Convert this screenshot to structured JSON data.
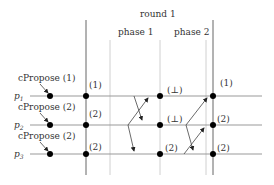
{
  "diagram": {
    "title": "round 1",
    "phases": [
      {
        "label": "phase 1"
      },
      {
        "label": "phase 2"
      }
    ],
    "processes": [
      {
        "name": "p1",
        "proposal": "cPropose (1)",
        "start_value": "(1)",
        "after_phase1": "(⊥)",
        "end_value": "(1)"
      },
      {
        "name": "p2",
        "proposal": "cPropose (2)",
        "start_value": "(2)",
        "after_phase1": "(⊥)",
        "end_value": "(2)"
      },
      {
        "name": "p3",
        "proposal": "cPropose (2)",
        "start_value": "(2)",
        "after_phase1": "(2)",
        "end_value": "(2)"
      }
    ],
    "colors": {
      "line": "#888888",
      "dark_line": "#555555",
      "light_line": "#cccccc",
      "dot": "#000000",
      "text": "#333333"
    }
  }
}
